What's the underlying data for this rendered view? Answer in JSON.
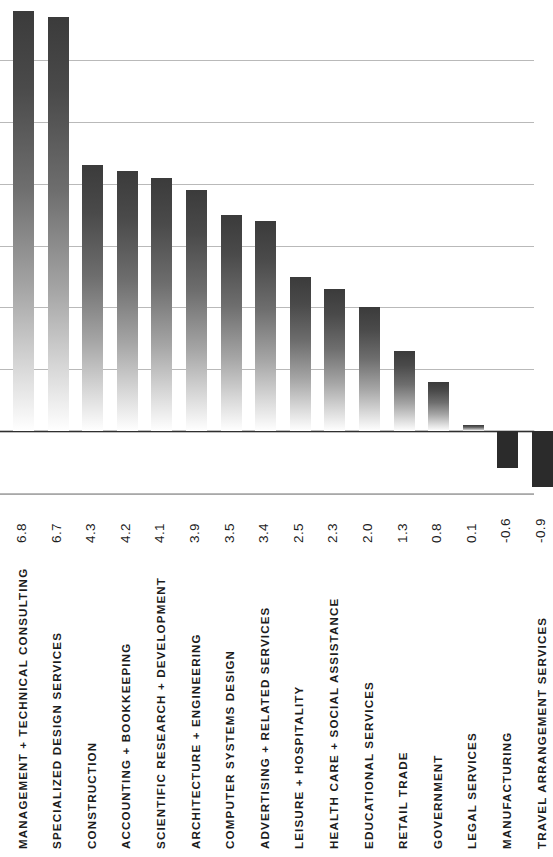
{
  "chart_data": {
    "type": "bar",
    "title": "",
    "subtitle": "",
    "xlabel": "",
    "ylabel": "",
    "orientation": "vertical",
    "grid": true,
    "legend": null,
    "ylim": [
      -1.5,
      7.0
    ],
    "y_gridlines": [
      7.0,
      6.0,
      5.0,
      4.0,
      3.0,
      2.0,
      1.0,
      0.0,
      -1.0
    ],
    "zero_axis": 0.0,
    "categories": [
      "MANAGEMENT + TECHNICAL CONSULTING",
      "SPECIALIZED DESIGN SERVICES",
      "CONSTRUCTION",
      "ACCOUNTING + BOOKKEEPING",
      "SCIENTIFIC RESEARCH + DEVELOPMENT",
      "ARCHITECTURE + ENGINEERING",
      "COMPUTER SYSTEMS DESIGN",
      "ADVERTISING + RELATED SERVICES",
      "LEISURE + HOSPITALITY",
      "HEALTH CARE + SOCIAL ASSISTANCE",
      "EDUCATIONAL SERVICES",
      "RETAIL TRADE",
      "GOVERNMENT",
      "LEGAL SERVICES",
      "MANUFACTURING",
      "TRAVEL ARRANGEMENT SERVICES"
    ],
    "values": [
      6.8,
      6.7,
      4.3,
      4.2,
      4.1,
      3.9,
      3.5,
      3.4,
      2.5,
      2.3,
      2.0,
      1.3,
      0.8,
      0.1,
      -0.6,
      -0.9
    ],
    "value_labels": [
      "6.8",
      "6.7",
      "4.3",
      "4.2",
      "4.1",
      "3.9",
      "3.5",
      "3.4",
      "2.5",
      "2.3",
      "2.0",
      "1.3",
      "0.8",
      "0.1",
      "-0.6",
      "-0.9"
    ]
  },
  "style": {
    "bar_color_top": "#3b3b3b",
    "bar_color_bottom": "#ffffff",
    "negative_bar_color": "#2b2b2b",
    "gridline_color": "#b9b9b9",
    "axis_color": "#2f2f2f",
    "text_color": "#1c1c1c",
    "background": "#ffffff"
  }
}
